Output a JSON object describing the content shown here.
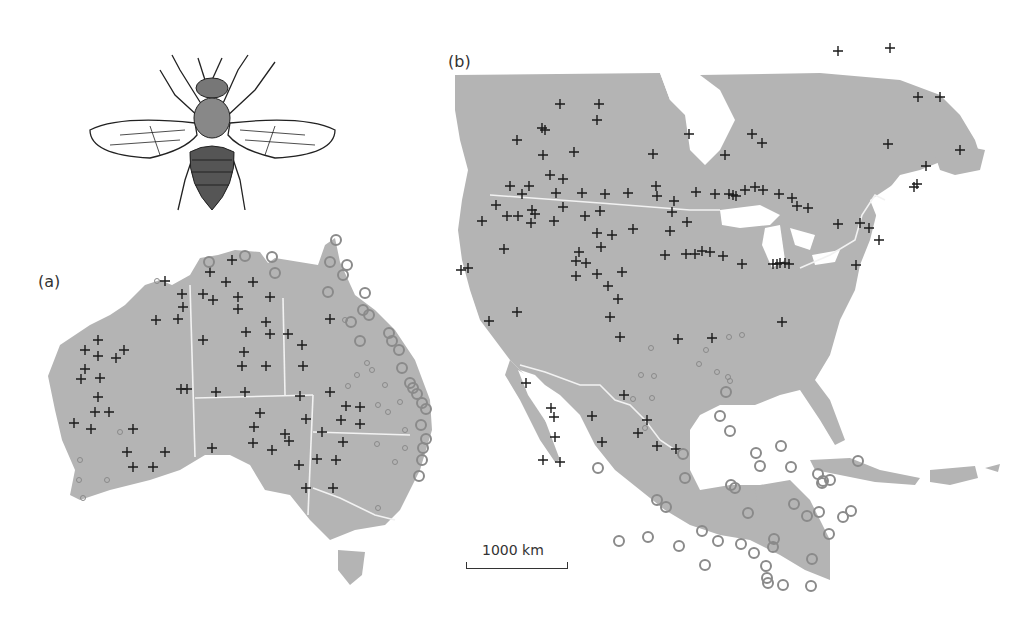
{
  "figure": {
    "panel_a_label": "(a)",
    "panel_b_label": "(b)",
    "scale_bar_label": "1000 km",
    "land_color": "#b4b4b4",
    "border_color": "#f2f2f2",
    "cross_color": "#1a1a1a",
    "circle_color": "#8a8a8a"
  },
  "legend_markers": {
    "cross": "absence-site",
    "circle": "presence-site"
  },
  "illustration": {
    "name": "fly-illustration"
  }
}
